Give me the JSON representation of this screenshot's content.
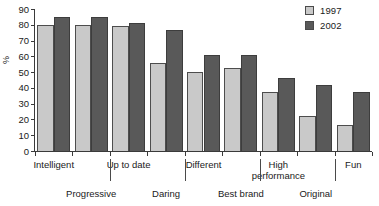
{
  "chart_data": {
    "type": "bar",
    "title": "",
    "xlabel": "",
    "ylabel": "%",
    "ylim": [
      0,
      90
    ],
    "yticks": [
      0,
      10,
      20,
      30,
      40,
      50,
      60,
      70,
      80,
      90
    ],
    "grid": false,
    "legend_position": "top-right",
    "categories": [
      "Intelligent",
      "Progressive",
      "Up to date",
      "Daring",
      "Different",
      "Best brand",
      "High performance",
      "Original",
      "Fun"
    ],
    "series": [
      {
        "name": "1997",
        "color": "#c9c9c9",
        "values": [
          80,
          80,
          79,
          56,
          50,
          52.5,
          37.5,
          22.5,
          16.5
        ]
      },
      {
        "name": "2002",
        "color": "#595959",
        "values": [
          85,
          85,
          81,
          77,
          61,
          61,
          46,
          42,
          37.5
        ]
      }
    ]
  },
  "legend": {
    "items": [
      {
        "label": "1997",
        "swatch": "#c9c9c9",
        "icon": "legend-swatch-light"
      },
      {
        "label": "2002",
        "swatch": "#595959",
        "icon": "legend-swatch-dark"
      }
    ]
  },
  "axes": {
    "y_axis_label": "%",
    "y_tick_labels": [
      "90",
      "80",
      "70",
      "60",
      "50",
      "40",
      "30",
      "20",
      "10",
      "0"
    ],
    "x_tick_labels_row_top": [
      "Intelligent",
      "Up to date",
      "Different",
      "High performance",
      "Fun"
    ],
    "x_tick_labels_row_bottom": [
      "Progressive",
      "Daring",
      "Best brand",
      "Original"
    ]
  }
}
